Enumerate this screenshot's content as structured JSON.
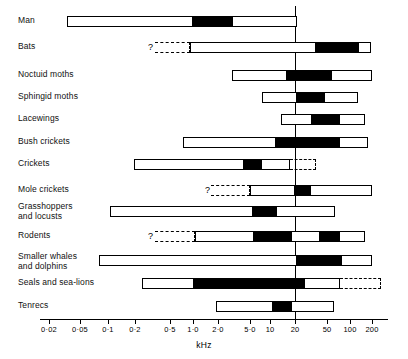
{
  "chart_data": {
    "type": "bar",
    "title": "",
    "xlabel": "kHz",
    "ylabel": "",
    "scale": "log",
    "xlim": [
      0.015,
      260
    ],
    "grid": false,
    "legend": null,
    "reference_line": {
      "value": 20,
      "label": ""
    },
    "tick_labels": [
      "0·02",
      "0·05",
      "0·1",
      "0·2",
      "0·5",
      "1·0",
      "2·0",
      "5·0",
      "10",
      "20",
      "50",
      "100",
      "200"
    ],
    "tick_values": [
      0.02,
      0.05,
      0.1,
      0.2,
      0.5,
      1.0,
      2.0,
      5.0,
      10,
      20,
      50,
      100,
      200
    ],
    "tick_px": [
      49,
      80,
      108,
      135,
      170,
      193,
      218,
      250,
      270,
      295,
      327,
      350,
      372
    ],
    "categories": [
      "Man",
      "Bats",
      "Noctuid moths",
      "Sphingid moths",
      "Lacewings",
      "Bush crickets",
      "Crickets",
      "Mole crickets",
      "Grasshoppers\nand locusts",
      "Rodents",
      "Smaller whales\nand dolphins",
      "Seals and sea-lions",
      "Tenrecs"
    ],
    "series": [
      {
        "name": "Man",
        "range_px": [
          67,
          297
        ],
        "range_khz": [
          0.03,
          20
        ],
        "emphasis_px": [
          [
            192,
            233
          ]
        ],
        "emphasis_khz": [
          [
            1.0,
            4.0
          ]
        ],
        "uncertain_px": null,
        "question_mark": false
      },
      {
        "name": "Bats",
        "range_px": [
          190,
          371
        ],
        "range_khz": [
          0.9,
          180
        ],
        "emphasis_px": [
          [
            315,
            359
          ]
        ],
        "emphasis_khz": [
          [
            30,
            120
          ]
        ],
        "uncertain_px": [
          155,
          190
        ],
        "question_mark": true
      },
      {
        "name": "Noctuid moths",
        "range_px": [
          232,
          372
        ],
        "range_khz": [
          3.0,
          200
        ],
        "emphasis_px": [
          [
            286,
            332
          ]
        ],
        "emphasis_khz": [
          [
            15,
            60
          ]
        ],
        "uncertain_px": null,
        "question_mark": false
      },
      {
        "name": "Sphingid moths",
        "range_px": [
          262,
          358
        ],
        "range_khz": [
          8.0,
          130
        ],
        "emphasis_px": [
          [
            296,
            325
          ]
        ],
        "emphasis_khz": [
          [
            20,
            50
          ]
        ],
        "uncertain_px": null,
        "question_mark": false
      },
      {
        "name": "Lacewings",
        "range_px": [
          281,
          365
        ],
        "range_khz": [
          13,
          160
        ],
        "emphasis_px": [
          [
            311,
            340
          ]
        ],
        "emphasis_khz": [
          [
            27,
            70
          ]
        ],
        "uncertain_px": null,
        "question_mark": false
      },
      {
        "name": "Bush crickets",
        "range_px": [
          183,
          368
        ],
        "range_khz": [
          0.8,
          170
        ],
        "emphasis_px": [
          [
            275,
            340
          ]
        ],
        "emphasis_khz": [
          [
            11,
            70
          ]
        ],
        "uncertain_px": null,
        "question_mark": false
      },
      {
        "name": "Crickets",
        "range_px": [
          134,
          290
        ],
        "range_khz": [
          0.2,
          18
        ],
        "emphasis_px": [
          [
            243,
            262
          ]
        ],
        "emphasis_khz": [
          [
            4.0,
            8.0
          ]
        ],
        "uncertain_px": [
          290,
          316
        ],
        "question_mark": false
      },
      {
        "name": "Mole crickets",
        "range_px": [
          250,
          372
        ],
        "range_khz": [
          5.0,
          200
        ],
        "emphasis_px": [
          [
            294,
            311
          ]
        ],
        "emphasis_khz": [
          [
            19,
            30
          ]
        ],
        "uncertain_px": [
          211,
          250
        ],
        "question_mark": true
      },
      {
        "name": "Grasshoppers and locusts",
        "range_px": [
          110,
          335
        ],
        "range_khz": [
          0.1,
          60
        ],
        "emphasis_px": [
          [
            252,
            277
          ]
        ],
        "emphasis_khz": [
          [
            5.2,
            12
          ]
        ],
        "uncertain_px": null,
        "question_mark": false
      },
      {
        "name": "Rodents",
        "range_px": [
          195,
          365
        ],
        "range_khz": [
          1.0,
          160
        ],
        "emphasis_px": [
          [
            253,
            292
          ],
          [
            319,
            340
          ]
        ],
        "emphasis_khz": [
          [
            5.5,
            18
          ],
          [
            43,
            70
          ]
        ],
        "uncertain_px": [
          155,
          195
        ],
        "question_mark": true
      },
      {
        "name": "Smaller whales and dolphins",
        "range_px": [
          99,
          372
        ],
        "range_khz": [
          0.07,
          200
        ],
        "emphasis_px": [
          [
            296,
            342
          ]
        ],
        "emphasis_khz": [
          [
            20,
            72
          ]
        ],
        "uncertain_px": null,
        "question_mark": false
      },
      {
        "name": "Seals and sea-lions",
        "range_px": [
          142,
          340
        ],
        "range_khz": [
          0.25,
          70
        ],
        "emphasis_px": [
          [
            193,
            305
          ]
        ],
        "emphasis_khz": [
          [
            1.0,
            24
          ]
        ],
        "uncertain_px": [
          340,
          381
        ],
        "question_mark": false
      },
      {
        "name": "Tenrecs",
        "range_px": [
          216,
          334
        ],
        "range_khz": [
          2.0,
          58
        ],
        "emphasis_px": [
          [
            272,
            292
          ]
        ],
        "emphasis_khz": [
          [
            10.5,
            18
          ]
        ],
        "uncertain_px": null,
        "question_mark": false
      }
    ],
    "row_px_tops": [
      16,
      42,
      70,
      92,
      114,
      137,
      159,
      185,
      206,
      231,
      255,
      278,
      301
    ],
    "label_px_tops": [
      16,
      42,
      70,
      92,
      114,
      137,
      159,
      185,
      202,
      231,
      252,
      278,
      301
    ],
    "question_mark_px": [
      null,
      148,
      null,
      null,
      null,
      null,
      null,
      205,
      null,
      148,
      null,
      null,
      null
    ]
  }
}
